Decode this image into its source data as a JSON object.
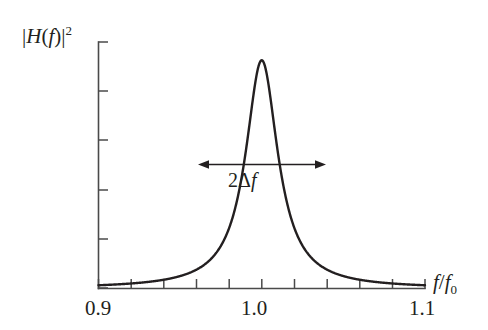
{
  "figure": {
    "background_color": "#ffffff",
    "curve_color": "#231f20",
    "axis_color": "#4a4a4a"
  },
  "labels": {
    "y_axis": "|H(f)|²",
    "y_axis_parts": {
      "bar_open": "|",
      "h": "H",
      "paren_open": "(",
      "f": "f",
      "paren_close": ")",
      "bar_close": "|",
      "exponent": "2"
    },
    "x_axis": "f/f₀",
    "x_axis_parts": {
      "f": "f",
      "slash": "/",
      "f0_base": "f",
      "f0_sub": "0"
    },
    "annotation": "2Δf",
    "annotation_parts": {
      "two": "2",
      "delta": "Δ",
      "f": "f"
    }
  },
  "chart_data": {
    "type": "line",
    "title": "",
    "xlabel": "f/f₀",
    "ylabel": "|H(f)|²",
    "xlim": [
      0.9,
      1.1
    ],
    "ylim": [
      0,
      1.08
    ],
    "grid": false,
    "legend": null,
    "x_tick_labels": [
      "0.9",
      "1.0",
      "1.1"
    ],
    "x_tick_label_values": [
      0.9,
      1.0,
      1.1
    ],
    "x_tick_count": 11,
    "x_tick_values": [
      0.9,
      0.92,
      0.94,
      0.96,
      0.98,
      1.0,
      1.02,
      1.04,
      1.06,
      1.08,
      1.1
    ],
    "y_tick_count": 6,
    "y_tick_values": [
      0.0,
      0.2,
      0.4,
      0.6,
      0.8,
      1.0
    ],
    "y_tick_labels": [],
    "series": [
      {
        "name": "|H(f)|²",
        "form": "lorentzian",
        "peak_x": 1.0,
        "peak_y": 1.0,
        "fwhm": 0.024,
        "x": [
          0.9,
          0.905,
          0.91,
          0.915,
          0.92,
          0.925,
          0.93,
          0.935,
          0.94,
          0.945,
          0.95,
          0.955,
          0.96,
          0.962,
          0.964,
          0.966,
          0.968,
          0.97,
          0.972,
          0.974,
          0.976,
          0.978,
          0.98,
          0.982,
          0.984,
          0.986,
          0.988,
          0.99,
          0.992,
          0.994,
          0.996,
          0.998,
          1.0,
          1.002,
          1.004,
          1.006,
          1.008,
          1.01,
          1.012,
          1.014,
          1.016,
          1.018,
          1.02,
          1.022,
          1.024,
          1.026,
          1.028,
          1.03,
          1.032,
          1.034,
          1.036,
          1.038,
          1.04,
          1.045,
          1.05,
          1.055,
          1.06,
          1.065,
          1.07,
          1.075,
          1.08,
          1.085,
          1.09,
          1.095,
          1.1
        ],
        "y": [
          0.0144,
          0.016,
          0.0178,
          0.0199,
          0.0224,
          0.0253,
          0.0288,
          0.033,
          0.0381,
          0.0444,
          0.0523,
          0.0624,
          0.0755,
          0.082,
          0.0894,
          0.0978,
          0.1074,
          0.1184,
          0.1311,
          0.1459,
          0.1631,
          0.1834,
          0.2075,
          0.2362,
          0.2708,
          0.3126,
          0.3635,
          0.4255,
          0.5006,
          0.5893,
          0.6882,
          0.786,
          0.8,
          0.786,
          0.6882,
          0.5893,
          0.5006,
          0.4255,
          0.3635,
          0.3126,
          0.2708,
          0.2362,
          0.2075,
          0.1834,
          0.1631,
          0.1459,
          0.1311,
          0.1184,
          0.1074,
          0.0978,
          0.0894,
          0.082,
          0.0755,
          0.0624,
          0.0523,
          0.0444,
          0.0381,
          0.033,
          0.0288,
          0.0253,
          0.0224,
          0.0199,
          0.0178,
          0.016,
          0.0144
        ]
      }
    ],
    "annotations": [
      {
        "text": "2Δf",
        "type": "double-arrow",
        "description": "full width at half maximum marker spanning the resonance peak",
        "x_start": 0.9875,
        "x_end": 1.0125,
        "y": 0.5
      }
    ]
  }
}
